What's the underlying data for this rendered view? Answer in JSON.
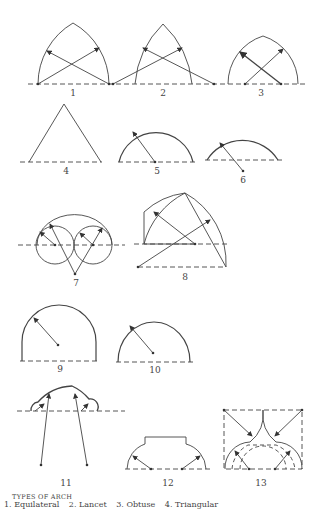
{
  "figure": {
    "labels": [
      {
        "n": "1",
        "x": 73,
        "y": 88
      },
      {
        "n": "2",
        "x": 163,
        "y": 88
      },
      {
        "n": "3",
        "x": 261,
        "y": 88
      },
      {
        "n": "4",
        "x": 66,
        "y": 168
      },
      {
        "n": "5",
        "x": 157,
        "y": 168
      },
      {
        "n": "6",
        "x": 243,
        "y": 176
      },
      {
        "n": "7",
        "x": 76,
        "y": 279
      },
      {
        "n": "8",
        "x": 185,
        "y": 273
      },
      {
        "n": "9",
        "x": 60,
        "y": 365
      },
      {
        "n": "10",
        "x": 155,
        "y": 366
      },
      {
        "n": "11",
        "x": 66,
        "y": 481
      },
      {
        "n": "12",
        "x": 168,
        "y": 481
      },
      {
        "n": "13",
        "x": 261,
        "y": 481
      }
    ],
    "caption_title": "TYPES OF ARCH",
    "caption_items": [
      "1. Equilateral",
      "2. Lancet",
      "3. Obtuse",
      "4. Triangular"
    ]
  },
  "colors": {
    "line": "#444444",
    "background": "#ffffff"
  }
}
